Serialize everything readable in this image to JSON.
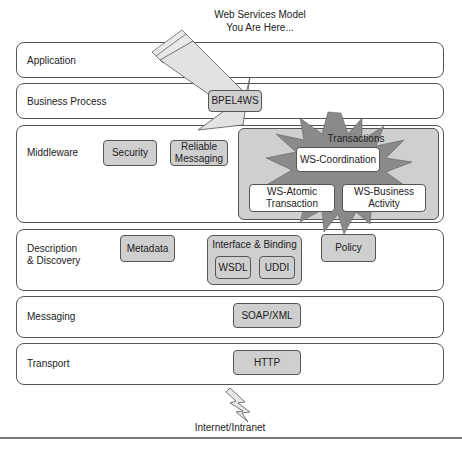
{
  "title": {
    "line1": "Web Services Model",
    "line2": "You Are Here..."
  },
  "layers": [
    {
      "id": "application",
      "label": "Application"
    },
    {
      "id": "business-process",
      "label": "Business Process",
      "items": [
        "BPEL4WS"
      ]
    },
    {
      "id": "middleware",
      "label": "Middleware",
      "items": [
        "Security",
        "Reliable Messaging"
      ],
      "transactions": {
        "label": "Transactions",
        "items": [
          "WS-Coordination",
          "WS-Atomic Transaction",
          "WS-Business Activity"
        ]
      }
    },
    {
      "id": "description-discovery",
      "label_line1": "Description",
      "label_line2": "& Discovery",
      "items": [
        "Metadata",
        "Policy"
      ],
      "interface_binding": {
        "label": "Interface & Binding",
        "items": [
          "WSDL",
          "UDDI"
        ]
      }
    },
    {
      "id": "messaging",
      "label": "Messaging",
      "items": [
        "SOAP/XML"
      ]
    },
    {
      "id": "transport",
      "label": "Transport",
      "items": [
        "HTTP"
      ]
    }
  ],
  "boxes": {
    "bpel": "BPEL4WS",
    "security": "Security",
    "reliable_l1": "Reliable",
    "reliable_l2": "Messaging",
    "ws_coordination": "WS-Coordination",
    "ws_atomic_l1": "WS-Atomic",
    "ws_atomic_l2": "Transaction",
    "ws_business_l1": "WS-Business",
    "ws_business_l2": "Activity",
    "metadata": "Metadata",
    "interface_binding": "Interface & Binding",
    "wsdl": "WSDL",
    "uddi": "UDDI",
    "policy": "Policy",
    "soap_xml": "SOAP/XML",
    "http": "HTTP",
    "transactions": "Transactions"
  },
  "footer": {
    "network_label": "Internet/Intranet"
  },
  "indicators": {
    "you_are_here_arrow": "arrow-pointing-to-BPEL4WS",
    "transactions_burst": "starburst-highlight"
  },
  "colors": {
    "box_fill": "#cfcfcf",
    "arrow_fill": "#e2e2e2",
    "star_fill": "#8a8a8a",
    "border": "#555555"
  }
}
